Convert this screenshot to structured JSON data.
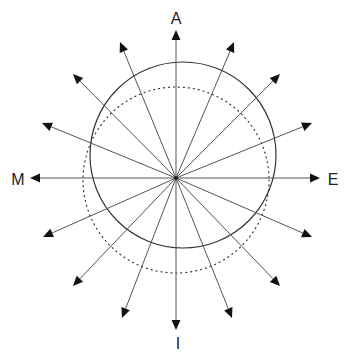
{
  "labels": {
    "top": "A",
    "bottom": "I",
    "left": "M",
    "right": "E"
  },
  "colors": {
    "stroke": "#555555",
    "arrowhead": "#111111",
    "circle": "#333333",
    "label": "#222222"
  },
  "geometry": {
    "center": [
      176,
      178
    ],
    "solid_circle": {
      "cx": 183,
      "cy": 155,
      "r": 93
    },
    "dotted_circle": {
      "cx": 176,
      "cy": 180,
      "r": 93
    },
    "arrow_tips": [
      [
        176,
        30
      ],
      [
        234,
        42
      ],
      [
        280,
        74
      ],
      [
        312,
        123
      ],
      [
        320,
        178
      ],
      [
        312,
        237
      ],
      [
        280,
        286
      ],
      [
        232,
        318
      ],
      [
        176,
        330
      ],
      [
        122,
        318
      ],
      [
        73,
        286
      ],
      [
        43,
        237
      ],
      [
        30,
        178
      ],
      [
        42,
        123
      ],
      [
        73,
        74
      ],
      [
        120,
        42
      ]
    ]
  }
}
